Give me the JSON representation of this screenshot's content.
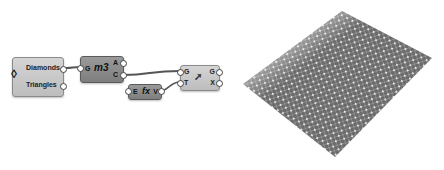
{
  "canvas": {
    "panel_node": {
      "outputs": [
        "Diamonds",
        "Triangles"
      ]
    },
    "mesh_node": {
      "inputs": [
        "G"
      ],
      "outputs": [
        "A",
        "C"
      ],
      "icon": "m3"
    },
    "expr_node": {
      "inputs": [
        "E"
      ],
      "outputs": [
        "V"
      ],
      "icon": "fx"
    },
    "transform_node": {
      "inputs": [
        "G",
        "T"
      ],
      "outputs": [
        "G",
        "X"
      ],
      "icon": "transform-icon"
    }
  },
  "viewport": {
    "description": "diamond patterned surface preview",
    "colors": {
      "surface": "#6b6b6b",
      "dots": "#f0f0f0",
      "grid": "#b0b0b0"
    }
  }
}
